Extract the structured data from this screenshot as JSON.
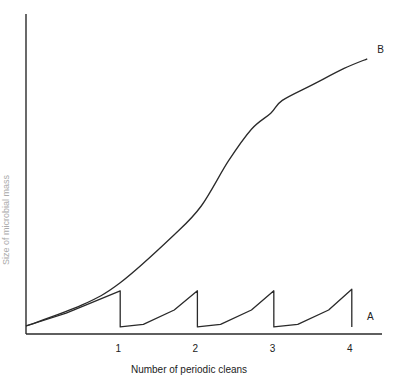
{
  "chart_data": {
    "type": "line",
    "title": "",
    "xlabel": "Number of periodic cleans",
    "ylabel": "Size of microbial mass",
    "x_ticks": [
      1,
      2,
      3,
      4
    ],
    "xlim": [
      -0.22,
      4.4
    ],
    "ylim": [
      0,
      100
    ],
    "grid": false,
    "legend": "inline labels at right end of each curve",
    "series": [
      {
        "name": "B",
        "description": "uncleaned growth (sigmoid)",
        "points": [
          [
            -0.22,
            2.5
          ],
          [
            0.5,
            9
          ],
          [
            1.0,
            16
          ],
          [
            1.7,
            31
          ],
          [
            2.05,
            40
          ],
          [
            2.4,
            54
          ],
          [
            2.7,
            64
          ],
          [
            2.95,
            69
          ],
          [
            3.1,
            73
          ],
          [
            3.5,
            78
          ],
          [
            3.9,
            83
          ],
          [
            4.2,
            86
          ]
        ]
      },
      {
        "name": "A",
        "description": "sawtooth with periodic cleaning",
        "points": [
          [
            -0.22,
            2.5
          ],
          [
            0.3,
            6.5
          ],
          [
            1.0,
            13.5
          ],
          [
            1.0,
            2.2
          ],
          [
            1.3,
            3
          ],
          [
            1.7,
            7.5
          ],
          [
            2.0,
            13.5
          ],
          [
            2.0,
            2.2
          ],
          [
            2.3,
            3
          ],
          [
            2.7,
            7.5
          ],
          [
            2.99,
            13.5
          ],
          [
            2.99,
            2.2
          ],
          [
            3.3,
            3
          ],
          [
            3.7,
            7.5
          ],
          [
            4.0,
            14
          ],
          [
            4.0,
            2.2
          ]
        ]
      }
    ]
  }
}
